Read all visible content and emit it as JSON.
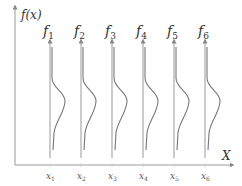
{
  "diagram": {
    "type": "conditional-distributions-along-x",
    "y_axis_label": "f(x)",
    "x_axis_label": "X",
    "colors": {
      "axis": "#888888",
      "line": "#999999",
      "curve": "#777777",
      "text": "#333333"
    },
    "functions": [
      {
        "name": "f",
        "sub": "1",
        "x_name": "x",
        "x_sub": "1"
      },
      {
        "name": "f",
        "sub": "2",
        "x_name": "x",
        "x_sub": "2"
      },
      {
        "name": "f",
        "sub": "3",
        "x_name": "x",
        "x_sub": "3"
      },
      {
        "name": "f",
        "sub": "4",
        "x_name": "x",
        "x_sub": "4"
      },
      {
        "name": "f",
        "sub": "5",
        "x_name": "x",
        "x_sub": "5"
      },
      {
        "name": "f",
        "sub": "6",
        "x_name": "x",
        "x_sub": "6"
      }
    ]
  }
}
